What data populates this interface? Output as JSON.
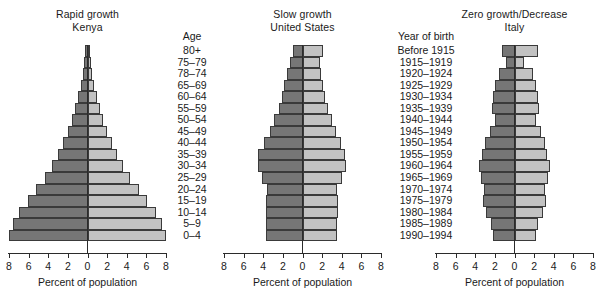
{
  "figure": {
    "axis_title": "Percent of population",
    "axis_ticks": [
      "8",
      "6",
      "4",
      "2",
      "0",
      "2",
      "4",
      "6",
      "8"
    ],
    "colors": {
      "male_bar": "#767676",
      "female_bar": "#c2c2c2",
      "outline": "#3a3a3a",
      "background": "#ffffff"
    }
  },
  "age_column": {
    "header": "Age",
    "items": [
      "80+",
      "75–79",
      "78–74",
      "65–69",
      "60–64",
      "55–59",
      "50–54",
      "45–49",
      "40–44",
      "35–39",
      "30–34",
      "25–29",
      "20–24",
      "15–19",
      "10–14",
      "5–9",
      "0–4"
    ]
  },
  "year_column": {
    "header": "Year of birth",
    "items": [
      "Before 1915",
      "1915–1919",
      "1920–1924",
      "1925–1929",
      "1930–1934",
      "1935–1939",
      "1940–1944",
      "1945–1949",
      "1950–1954",
      "1955–1959",
      "1960–1964",
      "1965–1969",
      "1970–1974",
      "1975–1979",
      "1980–1984",
      "1985–1989",
      "1990–1994"
    ]
  },
  "chart_data": [
    {
      "type": "bar",
      "subtype": "population-pyramid",
      "title": "Rapid growth",
      "subtitle": "Kenya",
      "xlabel": "Percent of population",
      "ylabel": "Age",
      "xlim": [
        -8,
        8
      ],
      "xticks": [
        -8,
        -6,
        -4,
        -2,
        0,
        2,
        4,
        6,
        8
      ],
      "xticklabels": [
        "8",
        "6",
        "4",
        "2",
        "0",
        "2",
        "4",
        "6",
        "8"
      ],
      "grid": false,
      "legend": null,
      "categories": [
        "80+",
        "75–79",
        "78–74",
        "65–69",
        "60–64",
        "55–59",
        "50–54",
        "45–49",
        "40–44",
        "35–39",
        "30–34",
        "25–29",
        "20–24",
        "15–19",
        "10–14",
        "5–9",
        "0–4"
      ],
      "series": [
        {
          "name": "Male",
          "side": "left",
          "color": "#767676",
          "values": [
            0.25,
            0.35,
            0.5,
            0.7,
            0.95,
            1.25,
            1.6,
            2.0,
            2.5,
            3.0,
            3.6,
            4.3,
            5.2,
            6.1,
            7.0,
            7.6,
            8.0
          ]
        },
        {
          "name": "Female",
          "side": "right",
          "color": "#c2c2c2",
          "values": [
            0.25,
            0.35,
            0.5,
            0.7,
            0.95,
            1.25,
            1.6,
            2.0,
            2.5,
            3.0,
            3.6,
            4.3,
            5.2,
            6.1,
            7.0,
            7.6,
            8.0
          ]
        }
      ]
    },
    {
      "type": "bar",
      "subtype": "population-pyramid",
      "title": "Slow growth",
      "subtitle": "United States",
      "xlabel": "Percent of population",
      "ylabel": "Year of birth",
      "xlim": [
        -8,
        8
      ],
      "xticks": [
        -8,
        -6,
        -4,
        -2,
        0,
        2,
        4,
        6,
        8
      ],
      "xticklabels": [
        "8",
        "6",
        "4",
        "2",
        "0",
        "2",
        "4",
        "6",
        "8"
      ],
      "grid": false,
      "legend": null,
      "categories": [
        "Before 1915",
        "1915–1919",
        "1920–1924",
        "1925–1929",
        "1930–1934",
        "1935–1939",
        "1940–1944",
        "1945–1949",
        "1950–1954",
        "1955–1959",
        "1960–1964",
        "1965–1969",
        "1970–1974",
        "1975–1979",
        "1980–1984",
        "1985–1989",
        "1990–1994"
      ],
      "series": [
        {
          "name": "Male",
          "side": "left",
          "color": "#767676",
          "values": [
            1.0,
            1.3,
            1.6,
            1.9,
            2.1,
            2.4,
            2.9,
            3.3,
            3.9,
            4.5,
            4.5,
            4.1,
            3.6,
            3.7,
            3.7,
            3.7,
            3.7
          ]
        },
        {
          "name": "Female",
          "side": "right",
          "color": "#c2c2c2",
          "values": [
            2.1,
            1.8,
            1.9,
            2.1,
            2.3,
            2.6,
            3.0,
            3.4,
            3.9,
            4.3,
            4.4,
            4.0,
            3.5,
            3.6,
            3.6,
            3.5,
            3.5
          ]
        }
      ]
    },
    {
      "type": "bar",
      "subtype": "population-pyramid",
      "title": "Zero growth/Decrease",
      "subtitle": "Italy",
      "xlabel": "Percent of population",
      "ylabel": "Year of birth",
      "xlim": [
        -8,
        8
      ],
      "xticks": [
        -8,
        -6,
        -4,
        -2,
        0,
        2,
        4,
        6,
        8
      ],
      "xticklabels": [
        "8",
        "6",
        "4",
        "2",
        "0",
        "2",
        "4",
        "6",
        "8"
      ],
      "grid": false,
      "legend": null,
      "categories": [
        "Before 1915",
        "1915–1919",
        "1920–1924",
        "1925–1929",
        "1930–1934",
        "1935–1939",
        "1940–1944",
        "1945–1949",
        "1950–1954",
        "1955–1959",
        "1960–1964",
        "1965–1969",
        "1970–1974",
        "1975–1979",
        "1980–1984",
        "1985–1989",
        "1990–1994"
      ],
      "series": [
        {
          "name": "Male",
          "side": "left",
          "color": "#767676",
          "values": [
            1.3,
            0.9,
            1.6,
            2.0,
            2.2,
            2.3,
            2.0,
            2.5,
            3.0,
            3.3,
            3.6,
            3.4,
            3.1,
            3.2,
            2.9,
            2.4,
            2.2
          ]
        },
        {
          "name": "Female",
          "side": "right",
          "color": "#c2c2c2",
          "values": [
            2.4,
            1.0,
            1.9,
            2.2,
            2.4,
            2.5,
            2.2,
            2.7,
            3.1,
            3.3,
            3.6,
            3.4,
            3.1,
            3.2,
            2.9,
            2.4,
            2.2
          ]
        }
      ]
    }
  ]
}
